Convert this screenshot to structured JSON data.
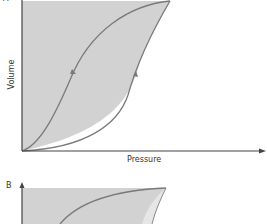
{
  "panels": [
    {
      "label": "A",
      "xlabel": "Pressure",
      "ylabel": "Volume",
      "description": "Pressure-volume hysteresis loop: inflation curve (right, arrow up) and deflation curve (left, arrow down), area between shaded"
    },
    {
      "label": "B",
      "description": "Second pressure-volume loop, partially visible, shaded with lighter region near upper right"
    }
  ],
  "colors": {
    "fill": "#d2d2d2",
    "fill_light": "#e6e6e6",
    "curve": "#7a7a7a",
    "axis": "#444444",
    "text": "#333333"
  }
}
